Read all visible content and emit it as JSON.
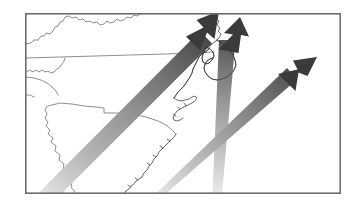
{
  "figure": {
    "kind": "map",
    "title": "Storm track map of the southeastern United States",
    "caption": "",
    "width": 361,
    "height": 211,
    "background_color": "#ffffff"
  },
  "frame": {
    "name": "map-border",
    "x": 25,
    "y": 13,
    "width": 316,
    "height": 181,
    "stroke_color": "#6e6e6e",
    "stroke_width": 1.6,
    "fill_color": "#ffffff"
  },
  "map": {
    "region_label": "Southeastern United States",
    "coastline_color": "#4a4a4a",
    "border_color": "#5a5a5a",
    "line_width": 0.7,
    "states_depicted": [
      "Kentucky",
      "Virginia",
      "Tennessee",
      "North Carolina",
      "South Carolina",
      "Georgia"
    ],
    "features": [
      "Atlantic coastline",
      "Outer Banks",
      "Cape Hatteras",
      "Pamlico Sound",
      "Chesapeake Bay approach",
      "Savannah River boundary"
    ]
  },
  "arrows": {
    "count": 3,
    "style": "tapered gradient shaft with solid dark arrowhead",
    "tail_color": "#e9e9e9",
    "mid_color": "#9a9a9a",
    "head_shaft_color": "#4f4f4f",
    "arrowhead_color": "#3b3b3b",
    "items": [
      {
        "id": "arrow-1",
        "name": "southwest-to-northeast-arrow",
        "label": "",
        "direction": "northeast",
        "bearing_degrees": 42,
        "tail_point": [
          30,
          200
        ],
        "head_point": [
          216,
          14
        ],
        "shaft_width_tail": 9,
        "shaft_width_head": 15
      },
      {
        "id": "arrow-2",
        "name": "south-to-north-arrow",
        "label": "",
        "direction": "north-northeast",
        "bearing_degrees": 8,
        "tail_point": [
          216,
          204
        ],
        "head_point": [
          231,
          20
        ],
        "shaft_width_tail": 9,
        "shaft_width_head": 16
      },
      {
        "id": "arrow-3",
        "name": "southwest-to-northeast-coastal-arrow",
        "label": "",
        "direction": "northeast",
        "bearing_degrees": 36,
        "tail_point": [
          148,
          205
        ],
        "head_point": [
          313,
          62
        ],
        "shaft_width_tail": 8,
        "shaft_width_head": 14
      }
    ]
  },
  "annotations": [],
  "legend": {
    "visible": false,
    "entries": []
  }
}
